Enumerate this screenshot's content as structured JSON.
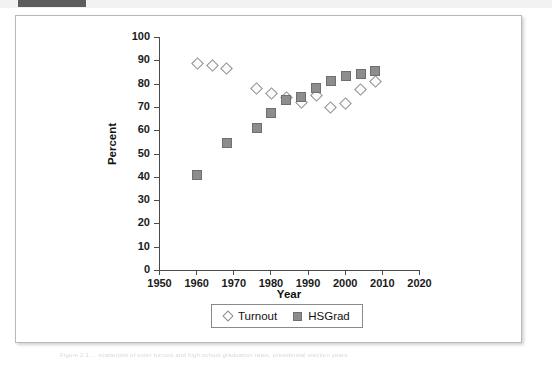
{
  "top_band": {
    "tab_color": "#5d5d5d",
    "band_color": "#f2f2f2"
  },
  "figure": {
    "background": "#ffffff",
    "border_color": "#b9b9b9"
  },
  "caption": {
    "text": "Figure 2.1 ... scatterplot of voter turnout and high school graduation rates, presidential election years."
  },
  "chart_data": {
    "type": "scatter",
    "title": "",
    "xlabel": "Year",
    "ylabel": "Percent",
    "xlim": [
      1950,
      2020
    ],
    "ylim": [
      0,
      100
    ],
    "xticks": [
      1950,
      1960,
      1970,
      1980,
      1990,
      2000,
      2010,
      2020
    ],
    "ytick_labels": [
      "0",
      "10",
      "20",
      "30",
      "40",
      "50",
      "60",
      "70",
      "80",
      "90",
      "100"
    ],
    "yticks": [
      0,
      10,
      20,
      30,
      40,
      50,
      60,
      70,
      80,
      90,
      100
    ],
    "grid": false,
    "legend_position": "bottom-center",
    "marker_colors": {
      "turnout": "#8d8d8d",
      "hsgrad": "#8d8d8d"
    },
    "series": [
      {
        "name": "Turnout",
        "marker": "open-diamond",
        "x": [
          1960,
          1964,
          1968,
          1976,
          1980,
          1984,
          1988,
          1992,
          1996,
          2000,
          2004,
          2008
        ],
        "values": [
          89,
          88,
          87,
          78.5,
          76,
          74.5,
          72.5,
          75.5,
          70,
          72,
          78,
          81.5
        ]
      },
      {
        "name": "HSGrad",
        "marker": "filled-square",
        "x": [
          1960,
          1968,
          1976,
          1980,
          1984,
          1988,
          1992,
          1996,
          2000,
          2004,
          2008
        ],
        "values": [
          41,
          55,
          61.5,
          68,
          73.5,
          74.5,
          78.5,
          81.5,
          83.5,
          84.5,
          86
        ]
      }
    ]
  }
}
